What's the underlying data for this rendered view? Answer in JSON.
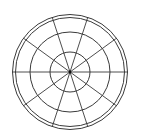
{
  "diagram": {
    "type": "polar-grid",
    "background": "#ffffff",
    "stroke_color": "#3a3a3a",
    "center": {
      "x": 70,
      "y": 72
    },
    "rings": [
      {
        "r": 20,
        "width": 1
      },
      {
        "r": 40,
        "width": 1
      },
      {
        "r": 54.5,
        "width": 1
      },
      {
        "r": 57.5,
        "width": 1
      }
    ],
    "spokes": {
      "count": 10,
      "start_angle_deg": 0,
      "step_deg": 36,
      "length": 57.5,
      "width": 0.9
    },
    "center_dot": {
      "r": 1.4
    }
  }
}
